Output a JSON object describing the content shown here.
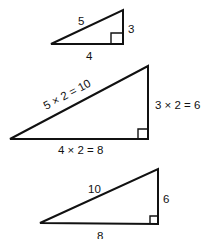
{
  "triangles": [
    {
      "name": "original",
      "hypotenuse": "5",
      "vertical_leg": "3",
      "horizontal_leg": "4"
    },
    {
      "name": "scaled-construction",
      "hypotenuse": "5 × 2 = 10",
      "vertical_leg": "3 × 2 = 6",
      "horizontal_leg": "4 × 2 = 8"
    },
    {
      "name": "scaled-result",
      "hypotenuse": "10",
      "vertical_leg": "6",
      "horizontal_leg": "8"
    }
  ],
  "colors": {
    "stroke": "#111111",
    "background": "#ffffff"
  }
}
